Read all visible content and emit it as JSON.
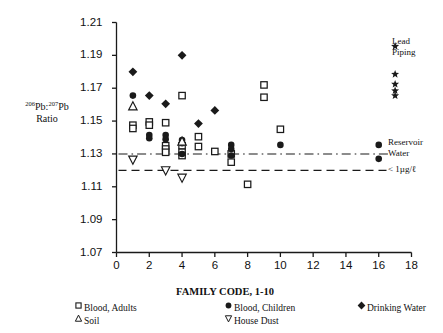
{
  "chart_data": {
    "type": "scatter",
    "title": "FAMILY CODE, 1-10",
    "xlabel": "FAMILY CODE, 1-10",
    "ylabel_line1_pre": "206",
    "ylabel_line1_mid": "Pb:",
    "ylabel_line1_sup2": "207",
    "ylabel_line1_post": "Pb",
    "ylabel_line2": "Ratio",
    "xlim": [
      0,
      18
    ],
    "ylim": [
      1.07,
      1.21
    ],
    "xticks": [
      "0",
      "2",
      "4",
      "6",
      "8",
      "10",
      "12",
      "14",
      "16",
      "18"
    ],
    "xtick_values": [
      0,
      2,
      4,
      6,
      8,
      10,
      12,
      14,
      16,
      18
    ],
    "yticks": [
      "1.21",
      "1.19",
      "1.17",
      "1.15",
      "1.13",
      "1.11",
      "1.09",
      "1.07"
    ],
    "ytick_values": [
      1.21,
      1.19,
      1.17,
      1.15,
      1.13,
      1.11,
      1.09,
      1.07
    ],
    "grid": false,
    "legend_position": "below-plot",
    "reference_lines": [
      {
        "name": "reservoir-water-line",
        "y": 1.13,
        "style": "dash-dot",
        "label": "Reservoir Water"
      },
      {
        "name": "less-than-1ug-line",
        "y": 1.12,
        "style": "dashed",
        "label": "< 1µg/ℓ"
      }
    ],
    "annotations": [
      {
        "name": "lead-piping",
        "text_line1": "Lead",
        "text_line2": "Piping",
        "x": 17,
        "y": 1.178
      },
      {
        "name": "reservoir-water",
        "text_line1": "Reservoir",
        "text_line2": "Water",
        "x": 18.2,
        "y": 1.13
      },
      {
        "name": "less-than-1ug",
        "text": "< 1µg/ℓ",
        "x": 18.2,
        "y": 1.12
      }
    ],
    "series": [
      {
        "name": "Blood, Adults",
        "marker": "open-square",
        "color": "#1a1a1a",
        "points": [
          {
            "x": 1,
            "y": 1.1475
          },
          {
            "x": 1,
            "y": 1.1455
          },
          {
            "x": 2,
            "y": 1.1495
          },
          {
            "x": 2,
            "y": 1.1475
          },
          {
            "x": 3,
            "y": 1.149
          },
          {
            "x": 3,
            "y": 1.135
          },
          {
            "x": 3,
            "y": 1.133
          },
          {
            "x": 3,
            "y": 1.131
          },
          {
            "x": 4,
            "y": 1.1655
          },
          {
            "x": 4,
            "y": 1.135
          },
          {
            "x": 4,
            "y": 1.131
          },
          {
            "x": 4,
            "y": 1.129
          },
          {
            "x": 5,
            "y": 1.1405
          },
          {
            "x": 5,
            "y": 1.1345
          },
          {
            "x": 6,
            "y": 1.1315
          },
          {
            "x": 7,
            "y": 1.13
          },
          {
            "x": 7,
            "y": 1.125
          },
          {
            "x": 8,
            "y": 1.1115
          },
          {
            "x": 9,
            "y": 1.172
          },
          {
            "x": 9,
            "y": 1.1645
          },
          {
            "x": 10,
            "y": 1.145
          }
        ]
      },
      {
        "name": "Blood, Children",
        "marker": "filled-circle",
        "color": "#1a1a1a",
        "points": [
          {
            "x": 1,
            "y": 1.1655
          },
          {
            "x": 2,
            "y": 1.1415
          },
          {
            "x": 2,
            "y": 1.1395
          },
          {
            "x": 3,
            "y": 1.1415
          },
          {
            "x": 3,
            "y": 1.139
          },
          {
            "x": 4,
            "y": 1.1385
          },
          {
            "x": 4,
            "y": 1.1365
          },
          {
            "x": 4,
            "y": 1.13
          },
          {
            "x": 7,
            "y": 1.1355
          },
          {
            "x": 7,
            "y": 1.133
          },
          {
            "x": 7,
            "y": 1.129
          },
          {
            "x": 10,
            "y": 1.1355
          },
          {
            "x": 16,
            "y": 1.1355
          },
          {
            "x": 16,
            "y": 1.127
          }
        ]
      },
      {
        "name": "Drinking Water",
        "marker": "filled-diamond",
        "color": "#1a1a1a",
        "points": [
          {
            "x": 1,
            "y": 1.18
          },
          {
            "x": 2,
            "y": 1.1655
          },
          {
            "x": 3,
            "y": 1.1605
          },
          {
            "x": 4,
            "y": 1.19
          },
          {
            "x": 5,
            "y": 1.1485
          },
          {
            "x": 6,
            "y": 1.1565
          }
        ]
      },
      {
        "name": "Soil",
        "marker": "open-triangle-up",
        "color": "#1a1a1a",
        "points": [
          {
            "x": 1,
            "y": 1.159
          },
          {
            "x": 4,
            "y": 1.1375
          }
        ]
      },
      {
        "name": "House Dust",
        "marker": "open-triangle-down",
        "color": "#1a1a1a",
        "points": [
          {
            "x": 1,
            "y": 1.1265
          },
          {
            "x": 3,
            "y": 1.12
          },
          {
            "x": 4,
            "y": 1.1155
          }
        ]
      },
      {
        "name": "Lead Piping",
        "marker": "filled-star",
        "color": "#1a1a1a",
        "points": [
          {
            "x": 17,
            "y": 1.1955
          },
          {
            "x": 17,
            "y": 1.1785
          },
          {
            "x": 17,
            "y": 1.1725
          },
          {
            "x": 17,
            "y": 1.1685
          },
          {
            "x": 17,
            "y": 1.1655
          }
        ]
      }
    ]
  },
  "legend": {
    "items": [
      {
        "label": "Blood, Adults",
        "marker": "open-square",
        "col": 0,
        "row": 0
      },
      {
        "label": "Soil",
        "marker": "open-triangle-up",
        "col": 0,
        "row": 1
      },
      {
        "label": "Blood, Children",
        "marker": "filled-circle",
        "col": 1,
        "row": 0
      },
      {
        "label": "House Dust",
        "marker": "open-triangle-down",
        "col": 1,
        "row": 1
      },
      {
        "label": "Drinking Water",
        "marker": "filled-diamond",
        "col": 2,
        "row": 0
      }
    ]
  }
}
